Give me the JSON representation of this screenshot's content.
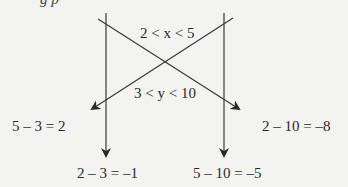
{
  "diagram": {
    "top_partial_text": "g   p",
    "interval_x": "2 < x < 5",
    "interval_y": "3 < y < 10",
    "results": {
      "left": "5 – 3 = 2",
      "right": "2 – 10 = –8",
      "bottom_left": "2 – 3 = –1",
      "bottom_right": "5 – 10 = –5"
    },
    "colors": {
      "line": "#3a3a3a",
      "text": "#2a2a2a",
      "background": "#f3f3f1"
    }
  }
}
